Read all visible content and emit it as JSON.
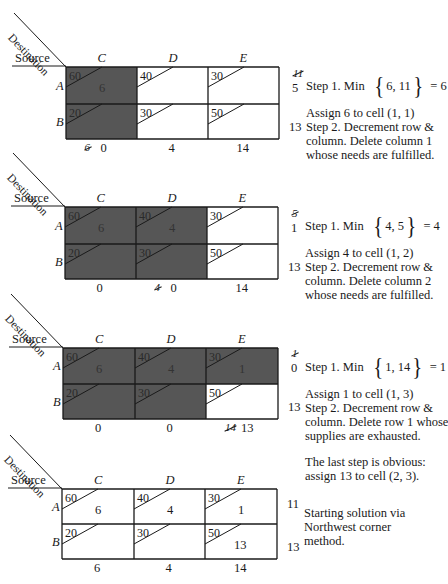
{
  "labels": {
    "source": "Source",
    "destination": "Destination"
  },
  "columns": [
    "C",
    "D",
    "E"
  ],
  "rows": [
    "A",
    "B"
  ],
  "colors": {
    "shade": "#565656",
    "line": "#1a1a1a",
    "bg": "#ffffff"
  },
  "costs": [
    [
      60,
      40,
      30
    ],
    [
      20,
      30,
      50
    ]
  ],
  "tableaux": [
    {
      "id": "step1",
      "shaded": [
        [
          true,
          false,
          false
        ],
        [
          true,
          false,
          false
        ]
      ],
      "allocations": [
        [
          "6",
          "",
          ""
        ],
        [
          "",
          "",
          ""
        ]
      ],
      "supply": [
        {
          "struck": "11",
          "value": "5"
        },
        {
          "struck": "",
          "value": "13"
        }
      ],
      "demand": [
        {
          "struck": "6",
          "value": "0"
        },
        {
          "struck": "",
          "value": "4"
        },
        {
          "struck": "",
          "value": "14"
        }
      ],
      "notes": {
        "min_prefix": "Step 1. Min",
        "min_set": "6, 11",
        "min_result": "= 6",
        "lines": [
          "Assign 6 to cell (1, 1)",
          "Step 2. Decrement row &",
          "column. Delete column 1",
          "whose needs are fulfilled."
        ]
      }
    },
    {
      "id": "step2",
      "shaded": [
        [
          true,
          true,
          false
        ],
        [
          true,
          true,
          false
        ]
      ],
      "allocations": [
        [
          "6",
          "4",
          ""
        ],
        [
          "",
          "",
          ""
        ]
      ],
      "supply": [
        {
          "struck": "5",
          "value": "1"
        },
        {
          "struck": "",
          "value": "13"
        }
      ],
      "demand": [
        {
          "struck": "",
          "value": "0"
        },
        {
          "struck": "4",
          "value": "0"
        },
        {
          "struck": "",
          "value": "14"
        }
      ],
      "notes": {
        "min_prefix": "Step 1. Min",
        "min_set": "4, 5",
        "min_result": "= 4",
        "lines": [
          "Assign 4 to cell (1, 2)",
          "Step 2. Decrement row &",
          "column. Delete column 2",
          "whose needs are fulfilled."
        ]
      }
    },
    {
      "id": "step3",
      "shaded": [
        [
          true,
          true,
          true
        ],
        [
          true,
          true,
          false
        ]
      ],
      "allocations": [
        [
          "6",
          "4",
          "1"
        ],
        [
          "",
          "",
          ""
        ]
      ],
      "supply": [
        {
          "struck": "1",
          "value": "0"
        },
        {
          "struck": "",
          "value": "13"
        }
      ],
      "demand": [
        {
          "struck": "",
          "value": "0"
        },
        {
          "struck": "",
          "value": "0"
        },
        {
          "struck": "14",
          "value": "13"
        }
      ],
      "notes": {
        "min_prefix": "Step 1. Min",
        "min_set": "1, 14",
        "min_result": "= 1",
        "lines": [
          "Assign 1 to cell (1, 3)",
          "Step 2. Decrement row &",
          "column. Delete row 1 whose",
          "supplies are exhausted."
        ],
        "extra": [
          "The last step is obvious:",
          "assign 13 to cell (2, 3)."
        ]
      }
    },
    {
      "id": "final",
      "shaded": [
        [
          false,
          false,
          false
        ],
        [
          false,
          false,
          false
        ]
      ],
      "allocations": [
        [
          "6",
          "4",
          "1"
        ],
        [
          "",
          "",
          "13"
        ]
      ],
      "supply": [
        {
          "struck": "",
          "value": "11"
        },
        {
          "struck": "",
          "value": "13"
        }
      ],
      "demand": [
        {
          "struck": "",
          "value": "6"
        },
        {
          "struck": "",
          "value": "4"
        },
        {
          "struck": "",
          "value": "14"
        }
      ],
      "notes": {
        "lines": [
          "Starting solution via",
          "Northwest corner",
          "method."
        ]
      }
    }
  ]
}
